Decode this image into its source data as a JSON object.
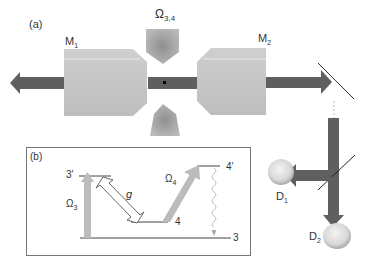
{
  "panel_a": {
    "label": "(a)",
    "mirror_left": {
      "name": "M",
      "sub": "1"
    },
    "mirror_right": {
      "name": "M",
      "sub": "2"
    },
    "pump_beam": {
      "name": "Ω",
      "sub": "3,4"
    },
    "detector_1": {
      "name": "D",
      "sub": "1"
    },
    "detector_2": {
      "name": "D",
      "sub": "2"
    }
  },
  "panel_b": {
    "label": "(b)",
    "levels": {
      "level_3p": "3′",
      "level_4p": "4′",
      "level_4": "4",
      "level_3": "3"
    },
    "coupling_g": "g",
    "omega3": {
      "name": "Ω",
      "sub": "3"
    },
    "omega4": {
      "name": "Ω",
      "sub": "4"
    }
  },
  "colors": {
    "beam": "#5f5f5f",
    "mirror": "#c8c8c8",
    "pump": "#a8a8a8",
    "box_border": "#777777"
  }
}
